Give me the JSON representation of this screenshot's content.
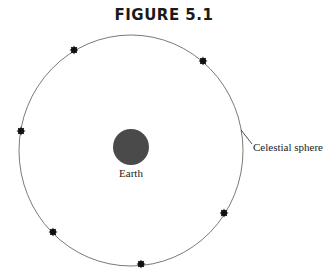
{
  "figure": {
    "title": "FIGURE 5.1",
    "earth_label": "Earth",
    "sphere_label": "Celestial sphere",
    "colors": {
      "earth": "#4a4a4a",
      "sphere_stroke": "#7a7a7a",
      "star": "#111111",
      "text": "#222222"
    },
    "sphere": {
      "cx": 131,
      "cy": 150.5,
      "rx": 112,
      "ry": 115.5
    },
    "earth": {
      "cx": 131,
      "cy": 147,
      "r": 18
    },
    "stars": [
      {
        "x": 74,
        "y": 50
      },
      {
        "x": 203,
        "y": 61
      },
      {
        "x": 21,
        "y": 131
      },
      {
        "x": 224,
        "y": 213
      },
      {
        "x": 53,
        "y": 232
      },
      {
        "x": 141,
        "y": 264
      }
    ],
    "leader_line": {
      "x1": 241,
      "y1": 130,
      "x2": 252,
      "y2": 144
    }
  }
}
